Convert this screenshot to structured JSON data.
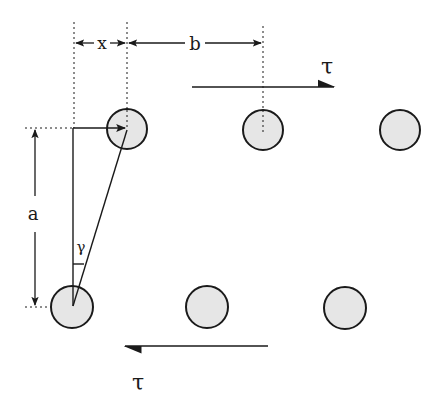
{
  "diagram": {
    "labels": {
      "x": "x",
      "b": "b",
      "a": "a",
      "gamma": "γ",
      "tau_top": "τ",
      "tau_bottom": "τ"
    },
    "particles": [
      {
        "row": "top",
        "cx": 127,
        "cy": 129
      },
      {
        "row": "top",
        "cx": 263,
        "cy": 130
      },
      {
        "row": "top",
        "cx": 400,
        "cy": 130
      },
      {
        "row": "bottom",
        "cx": 72,
        "cy": 307
      },
      {
        "row": "bottom",
        "cx": 207,
        "cy": 307
      },
      {
        "row": "bottom",
        "cx": 345,
        "cy": 308
      }
    ],
    "colors": {
      "stroke": "#1a1a1a",
      "particle_fill": "#e6e6e6",
      "background": "#ffffff"
    }
  }
}
